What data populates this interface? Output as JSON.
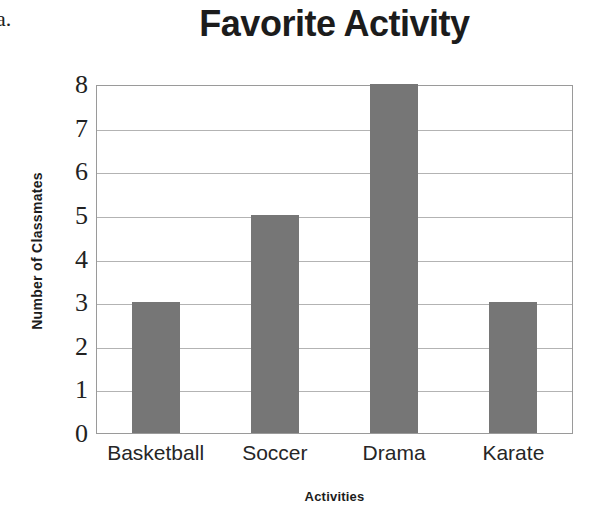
{
  "problem_label": "a.",
  "chart_data": {
    "type": "bar",
    "title": "Favorite Activity",
    "xlabel": "Activities",
    "ylabel": "Number of Classmates",
    "categories": [
      "Basketball",
      "Soccer",
      "Drama",
      "Karate"
    ],
    "values": [
      3,
      5,
      8,
      3
    ],
    "ylim": [
      0,
      8
    ],
    "ytick_labels": [
      "8",
      "7",
      "6",
      "5",
      "4",
      "3",
      "2",
      "1",
      "0"
    ],
    "ytick_values": [
      8,
      7,
      6,
      5,
      4,
      3,
      2,
      1,
      0
    ],
    "grid": true,
    "legend": false,
    "bar_color": "#767676",
    "grid_color": "#b3b3b3",
    "plot_border_color": "#9a9a9a",
    "background_color": "#ffffff",
    "text_color": "#1c1c1c"
  }
}
